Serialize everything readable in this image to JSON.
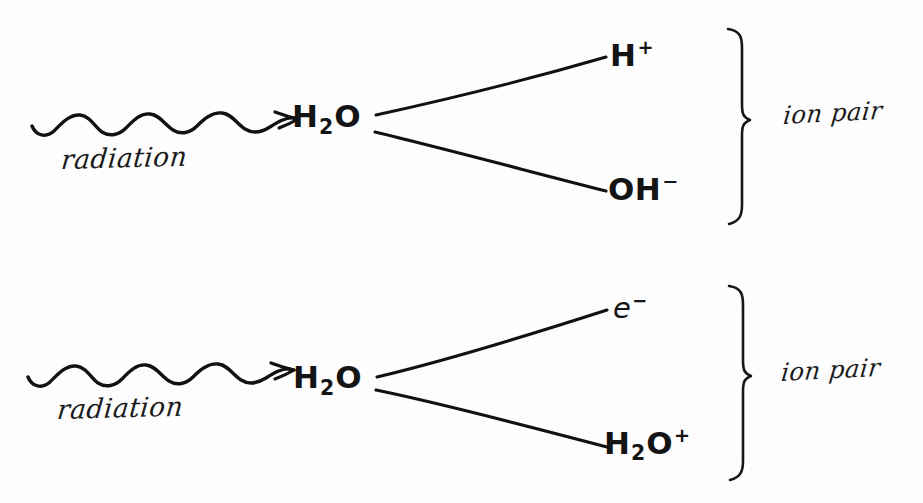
{
  "document": {
    "kind": "hand-drawn-diagram",
    "title": "Radiolysis of water producing ion pairs",
    "background_color": "#fdfdfd",
    "ink_color": "#141414",
    "width": 923,
    "height": 503
  },
  "reactions": [
    {
      "id": "reaction-1",
      "stimulus_label": "radiation",
      "stimulus_icon": "wavy-arrow-icon",
      "reactant": {
        "text": "H2O",
        "base": "H",
        "subscript": "2",
        "element": "O",
        "charge": ""
      },
      "products": [
        {
          "id": "product-h-plus",
          "base": "H",
          "subscript": "",
          "element": "",
          "charge": "+",
          "plain": "H+"
        },
        {
          "id": "product-oh-minus",
          "base": "OH",
          "subscript": "",
          "element": "",
          "charge": "−",
          "plain": "OH−"
        }
      ],
      "grouping_icon": "right-curly-brace-icon",
      "grouping_label": "ion pair"
    },
    {
      "id": "reaction-2",
      "stimulus_label": "radiation",
      "stimulus_icon": "wavy-arrow-icon",
      "reactant": {
        "text": "H2O",
        "base": "H",
        "subscript": "2",
        "element": "O",
        "charge": ""
      },
      "products": [
        {
          "id": "product-electron",
          "base": "e",
          "subscript": "",
          "element": "",
          "charge": "−",
          "plain": "e−"
        },
        {
          "id": "product-h2o-plus",
          "base": "H",
          "subscript": "2",
          "element": "O",
          "charge": "+",
          "plain": "H2O+"
        }
      ],
      "grouping_icon": "right-curly-brace-icon",
      "grouping_label": "ion pair"
    }
  ],
  "labels": {
    "radiation": "radiation",
    "ion_pair": "ion pair",
    "water": "H",
    "water_sub": "2",
    "water_o": "O",
    "h_symbol": "H",
    "plus_charge": "+",
    "minus_charge": "−",
    "oh_symbol": "OH",
    "electron_symbol": "e"
  }
}
